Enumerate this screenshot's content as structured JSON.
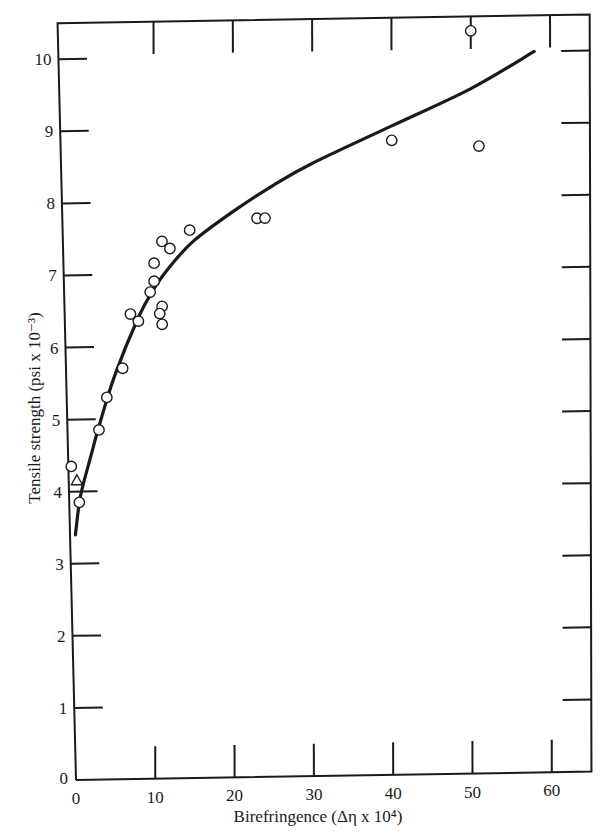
{
  "chart_data": {
    "type": "scatter",
    "title": "",
    "xlabel": "Birefringence (Δη x 10⁴)",
    "ylabel": "Tensile strength (psi x 10⁻³)",
    "xlim": [
      0,
      65
    ],
    "ylim": [
      0,
      10.5
    ],
    "xticks": [
      0,
      10,
      20,
      30,
      40,
      50,
      60
    ],
    "yticks": [
      0,
      1,
      2,
      3,
      4,
      5,
      6,
      7,
      8,
      9,
      10
    ],
    "grid": false,
    "legend": null,
    "series": [
      {
        "name": "circles",
        "marker": "open-circle",
        "points": [
          [
            -0.5,
            4.35
          ],
          [
            0.5,
            3.85
          ],
          [
            3,
            4.85
          ],
          [
            4,
            5.3
          ],
          [
            6,
            5.7
          ],
          [
            7,
            6.45
          ],
          [
            8,
            6.35
          ],
          [
            9.5,
            6.75
          ],
          [
            10,
            6.9
          ],
          [
            10,
            7.15
          ],
          [
            11,
            7.45
          ],
          [
            12,
            7.35
          ],
          [
            11,
            6.55
          ],
          [
            10.7,
            6.45
          ],
          [
            11,
            6.3
          ],
          [
            14.5,
            7.6
          ],
          [
            23,
            7.75
          ],
          [
            24,
            7.75
          ],
          [
            40,
            8.8
          ],
          [
            50,
            10.3
          ],
          [
            51,
            8.7
          ]
        ]
      },
      {
        "name": "triangle",
        "marker": "open-triangle",
        "points": [
          [
            0.2,
            4.15
          ]
        ]
      },
      {
        "name": "fit-curve",
        "marker": "line",
        "points": [
          [
            0,
            3.4
          ],
          [
            0.5,
            3.85
          ],
          [
            1,
            4.1
          ],
          [
            2,
            4.5
          ],
          [
            3,
            4.9
          ],
          [
            5,
            5.6
          ],
          [
            8,
            6.4
          ],
          [
            10,
            6.8
          ],
          [
            12,
            7.1
          ],
          [
            15,
            7.45
          ],
          [
            20,
            7.85
          ],
          [
            25,
            8.2
          ],
          [
            30,
            8.5
          ],
          [
            40,
            9.0
          ],
          [
            50,
            9.5
          ],
          [
            58,
            10.0
          ]
        ]
      }
    ]
  }
}
